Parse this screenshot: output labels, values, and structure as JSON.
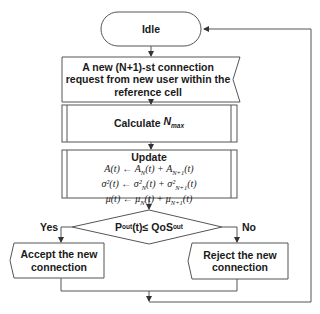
{
  "nodes": {
    "idle": {
      "label": "Idle"
    },
    "request": {
      "lines": [
        "A new (N+1)-st connection",
        "request from new user within the",
        "reference cell"
      ]
    },
    "calculate": {
      "label": "Calculate ",
      "var": "N",
      "sub": "max"
    },
    "update": {
      "title": "Update",
      "formulas": [
        {
          "lhs": "A(t)",
          "arrow": "←",
          "t1": "A",
          "s1": "N",
          "p1": "(t) + ",
          "t2": "A",
          "s2": "N+1",
          "p2": "(t)"
        },
        {
          "lhs": "σ²(t)",
          "arrow": "←",
          "t1": "σ²",
          "s1": "N",
          "p1": "(t) + ",
          "t2": "σ²",
          "s2": "N+1",
          "p2": "(t)"
        },
        {
          "lhs": "μ(t)",
          "arrow": "←",
          "t1": "μ",
          "s1": "N",
          "p1": "(t) + ",
          "t2": "μ",
          "s2": "N+1",
          "p2": "(t)"
        }
      ]
    },
    "decision": {
      "p": "P",
      "p_sub": "out",
      "mid": "(t)≤ QoS",
      "q_sub": "out"
    },
    "accept": {
      "lines": [
        "Accept the new",
        "connection"
      ]
    },
    "reject": {
      "lines": [
        "Reject the new",
        "connection"
      ]
    }
  },
  "edges": {
    "yes_label": "Yes",
    "no_label": "No"
  },
  "colors": {
    "stroke": "#555555",
    "text": "#1a1a1a",
    "background": "#ffffff"
  }
}
